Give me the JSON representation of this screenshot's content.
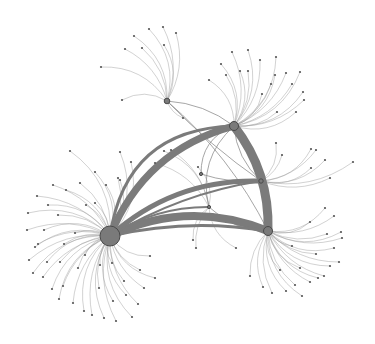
{
  "title": "",
  "colors": {
    "background": "#ffffff",
    "hub_fill": "#7a7a7a",
    "hub_stroke": "#4a4a4a",
    "hub_edge": "#7b7b7b",
    "leaf_edge": "#9a9a9a",
    "leaf_node": "#555555"
  },
  "hubs": [
    {
      "id": "A",
      "x": 110,
      "y": 236,
      "r": 10
    },
    {
      "id": "B",
      "x": 234,
      "y": 126,
      "r": 4.5
    },
    {
      "id": "C",
      "x": 268,
      "y": 231,
      "r": 4.5
    },
    {
      "id": "D",
      "x": 167,
      "y": 101,
      "r": 2.8
    },
    {
      "id": "E",
      "x": 261,
      "y": 181,
      "r": 2.2
    },
    {
      "id": "F",
      "x": 201,
      "y": 174,
      "r": 1.6
    },
    {
      "id": "G",
      "x": 209,
      "y": 207,
      "r": 1.6
    }
  ],
  "hub_edges": [
    {
      "from": "A",
      "to": "B",
      "width": 7,
      "bend": -0.25
    },
    {
      "from": "A",
      "to": "C",
      "width": 8,
      "bend": -0.22
    },
    {
      "from": "A",
      "to": "E",
      "width": 5,
      "bend": -0.2
    },
    {
      "from": "B",
      "to": "C",
      "width": 9,
      "bend": -0.18
    },
    {
      "from": "A",
      "to": "B",
      "width": 3,
      "bend": -0.42
    },
    {
      "from": "A",
      "to": "C",
      "width": 3,
      "bend": -0.1
    },
    {
      "from": "A",
      "to": "E",
      "width": 2,
      "bend": -0.1
    },
    {
      "from": "A",
      "to": "G",
      "width": 2,
      "bend": -0.15
    }
  ],
  "cross_edges": [
    {
      "from": "D",
      "to": "E",
      "bend": 0.05
    },
    {
      "from": "D",
      "to": "C",
      "bend": -0.1
    },
    {
      "from": "B",
      "to": "G",
      "bend": 0.3
    },
    {
      "from": "B",
      "to": "F",
      "bend": 0.35
    },
    {
      "from": "B",
      "to": "E",
      "bend": 0.2
    },
    {
      "from": "D",
      "to": "B",
      "bend": -0.15
    },
    {
      "from": "F",
      "to": "E",
      "bend": 0.1
    },
    {
      "from": "G",
      "to": "C",
      "bend": 0.2
    }
  ],
  "leaves": {
    "A": [
      [
        70,
        151
      ],
      [
        53,
        185
      ],
      [
        48,
        205
      ],
      [
        37,
        196
      ],
      [
        28,
        213
      ],
      [
        27,
        230
      ],
      [
        35,
        247
      ],
      [
        29,
        260
      ],
      [
        33,
        273
      ],
      [
        43,
        277
      ],
      [
        52,
        289
      ],
      [
        63,
        286
      ],
      [
        59,
        299
      ],
      [
        73,
        303
      ],
      [
        84,
        311
      ],
      [
        92,
        315
      ],
      [
        104,
        318
      ],
      [
        116,
        321
      ],
      [
        132,
        317
      ],
      [
        138,
        304
      ],
      [
        126,
        295
      ],
      [
        144,
        288
      ],
      [
        155,
        278
      ],
      [
        140,
        270
      ],
      [
        150,
        256
      ],
      [
        124,
        281
      ],
      [
        113,
        301
      ],
      [
        99,
        288
      ],
      [
        78,
        268
      ],
      [
        60,
        262
      ],
      [
        44,
        230
      ],
      [
        58,
        215
      ],
      [
        66,
        190
      ],
      [
        80,
        183
      ],
      [
        95,
        172
      ],
      [
        86,
        205
      ],
      [
        106,
        185
      ],
      [
        95,
        203
      ],
      [
        120,
        180
      ],
      [
        75,
        233
      ],
      [
        85,
        255
      ],
      [
        100,
        265
      ],
      [
        112,
        263
      ],
      [
        64,
        244
      ],
      [
        47,
        262
      ],
      [
        38,
        244
      ],
      [
        120,
        152
      ],
      [
        118,
        178
      ],
      [
        131,
        162
      ]
    ],
    "B": [
      [
        221,
        64
      ],
      [
        232,
        52
      ],
      [
        248,
        50
      ],
      [
        260,
        60
      ],
      [
        276,
        57
      ],
      [
        286,
        73
      ],
      [
        300,
        72
      ],
      [
        292,
        84
      ],
      [
        303,
        92
      ],
      [
        304,
        100
      ],
      [
        296,
        112
      ],
      [
        271,
        84
      ],
      [
        240,
        71
      ],
      [
        226,
        75
      ],
      [
        209,
        80
      ],
      [
        277,
        112
      ],
      [
        262,
        94
      ],
      [
        248,
        71
      ],
      [
        275,
        75
      ]
    ],
    "C": [
      [
        325,
        208
      ],
      [
        334,
        216
      ],
      [
        341,
        232
      ],
      [
        342,
        238
      ],
      [
        334,
        248
      ],
      [
        339,
        262
      ],
      [
        330,
        266
      ],
      [
        324,
        276
      ],
      [
        318,
        278
      ],
      [
        310,
        282
      ],
      [
        302,
        296
      ],
      [
        295,
        285
      ],
      [
        286,
        291
      ],
      [
        272,
        293
      ],
      [
        263,
        287
      ],
      [
        250,
        276
      ],
      [
        300,
        268
      ],
      [
        316,
        254
      ],
      [
        310,
        222
      ],
      [
        292,
        246
      ],
      [
        280,
        270
      ],
      [
        327,
        234
      ]
    ],
    "D": [
      [
        101,
        67
      ],
      [
        125,
        49
      ],
      [
        134,
        36
      ],
      [
        142,
        48
      ],
      [
        149,
        29
      ],
      [
        163,
        27
      ],
      [
        164,
        45
      ],
      [
        176,
        33
      ],
      [
        122,
        100
      ],
      [
        183,
        118
      ]
    ],
    "E": [
      [
        276,
        143
      ],
      [
        316,
        150
      ],
      [
        325,
        160
      ],
      [
        353,
        162
      ],
      [
        311,
        168
      ],
      [
        330,
        178
      ],
      [
        311,
        149
      ],
      [
        282,
        155
      ]
    ],
    "G": [
      [
        193,
        240
      ],
      [
        196,
        248
      ],
      [
        236,
        248
      ],
      [
        171,
        150
      ],
      [
        198,
        167
      ],
      [
        155,
        163
      ],
      [
        164,
        151
      ]
    ]
  }
}
